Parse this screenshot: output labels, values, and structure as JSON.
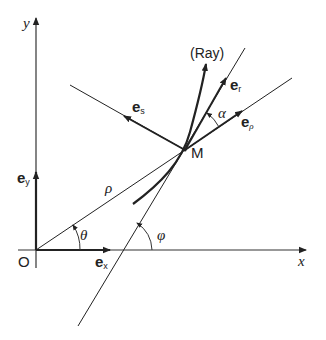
{
  "diagram": {
    "type": "geometry",
    "colors": {
      "line": "#222222",
      "background": "#ffffff"
    },
    "axes": {
      "x_label": "x",
      "y_label": "y",
      "origin_label": "O"
    },
    "points": {
      "M": "M"
    },
    "vectors": {
      "ex": {
        "base": "e",
        "sub": "x"
      },
      "ey": {
        "base": "e",
        "sub": "y"
      },
      "er": {
        "base": "e",
        "sub": "r"
      },
      "es": {
        "base": "e",
        "sub": "s"
      },
      "erho": {
        "base": "e",
        "sub": "ρ"
      }
    },
    "labels": {
      "ray": "(Ray)",
      "rho": "ρ",
      "theta": "θ",
      "phi": "φ",
      "alpha": "α"
    }
  }
}
